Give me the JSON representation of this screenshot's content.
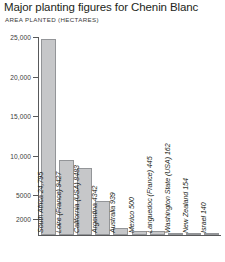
{
  "chart_data": {
    "type": "bar",
    "title": "Major planting figures for Chenin Blanc",
    "subtitle": "AREA PLANTED (HECTARES)",
    "xlabel": "",
    "ylabel": "AREA PLANTED (HECTARES)",
    "ylim": [
      0,
      25000
    ],
    "yticks": [
      2000,
      5000,
      10000,
      15000,
      20000,
      25000
    ],
    "ytick_labels": [
      "2000",
      "5000",
      "10,000",
      "15,000",
      "20,000",
      "25,000"
    ],
    "grid": false,
    "legend": null,
    "bar_color": "#c6c7c9",
    "bar_edge_color": "#939598",
    "axis_color": "#58595b",
    "categories": [
      "South Africa",
      "Loire (France)",
      "California (USA)",
      "Argentina",
      "Australia",
      "Mexico",
      "Languedoc (France)",
      "Washington State (USA)",
      "New Zealand",
      "Israel"
    ],
    "values": [
      24795,
      9427,
      8483,
      4342,
      939,
      500,
      445,
      162,
      154,
      140
    ],
    "bar_labels": [
      "South Africa 24,795",
      "Loire (France) 9427",
      "California (USA) 8483",
      "Argentina 4342",
      "Australia 939",
      "Mexico 500",
      "Languedoc (France) 445",
      "Washington State (USA) 162",
      "New Zealand 154",
      "Israel 140"
    ]
  }
}
